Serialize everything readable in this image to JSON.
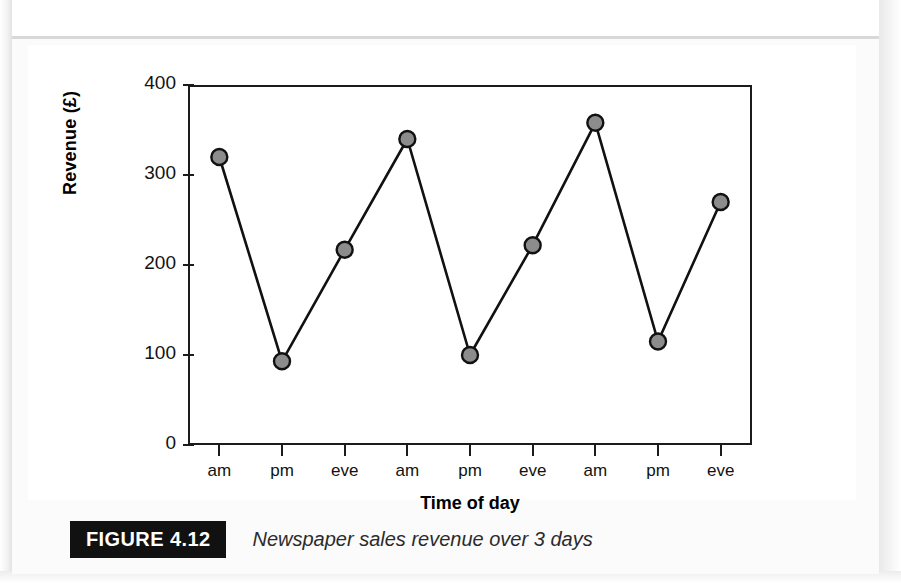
{
  "figure": {
    "badge": "FIGURE 4.12",
    "caption": "Newspaper sales revenue over 3 days"
  },
  "chart_data": {
    "type": "line",
    "title": "",
    "xlabel": "Time of day",
    "ylabel": "Revenue (£)",
    "categories": [
      "am",
      "pm",
      "eve",
      "am",
      "pm",
      "eve",
      "am",
      "pm",
      "eve"
    ],
    "values": [
      320,
      93,
      217,
      340,
      100,
      222,
      358,
      115,
      270
    ],
    "series": [
      {
        "name": "Newspaper sales revenue",
        "values": [
          320,
          93,
          217,
          340,
          100,
          222,
          358,
          115,
          270
        ]
      }
    ],
    "ylim": [
      0,
      400
    ],
    "yticks": [
      0,
      100,
      200,
      300,
      400
    ],
    "ytick_labels": [
      "0",
      "100",
      "200",
      "300",
      "400"
    ],
    "grid": false,
    "legend": false,
    "legend_position": "none",
    "marker": "circle",
    "marker_fill": "#8c8c8c",
    "marker_edge": "#111111",
    "line_color": "#111111",
    "plot_background": "#ffffff"
  }
}
